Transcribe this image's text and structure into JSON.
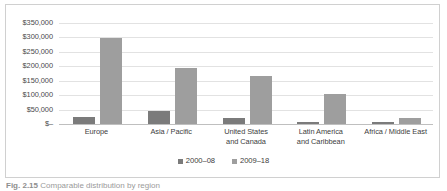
{
  "chart_data": {
    "type": "bar",
    "title": "",
    "subtitle": "",
    "xlabel": "",
    "ylabel": "",
    "ylim": [
      0,
      350000
    ],
    "grid": true,
    "legend_position": "bottom",
    "y_ticks": [
      "$350,000",
      "$300,000",
      "$250,000",
      "$200,000",
      "$150,000",
      "$100,000",
      "$50,000",
      "$–"
    ],
    "y_tick_values": [
      350000,
      300000,
      250000,
      200000,
      150000,
      100000,
      50000,
      0
    ],
    "categories": [
      "Europe",
      "Asia / Pacific",
      "United States and Canada",
      "Latin America and Caribbean",
      "Africa / Middle East"
    ],
    "category_lines": [
      [
        "Europe",
        ""
      ],
      [
        "Asia / Pacific",
        ""
      ],
      [
        "United States",
        "and Canada"
      ],
      [
        "Latin America",
        "and Caribbean"
      ],
      [
        "Africa / Middle East",
        ""
      ]
    ],
    "series": [
      {
        "name": "2000–08",
        "color": "#7b7b7b",
        "values": [
          25000,
          45000,
          20000,
          4000,
          3000
        ]
      },
      {
        "name": "2009–18",
        "color": "#9e9e9e",
        "values": [
          298000,
          195000,
          168000,
          105000,
          22000
        ]
      }
    ]
  },
  "legend": {
    "items": [
      {
        "label": "2000–08",
        "color": "#7b7b7b"
      },
      {
        "label": "2009–18",
        "color": "#9e9e9e"
      }
    ]
  },
  "caption": {
    "label": "Fig. 2.15",
    "text": "Comparable distribution by region"
  },
  "colors": {
    "series_0": "#7b7b7b",
    "series_1": "#9e9e9e",
    "gridline": "#e2e2e2",
    "axis": "#bfbfbf",
    "frame": "#d0d0d0",
    "text": "#404040"
  }
}
